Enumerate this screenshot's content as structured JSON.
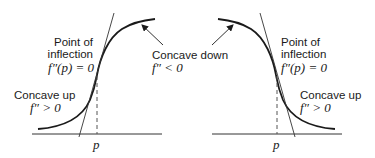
{
  "left_panel": {
    "inflection_label_line1": "Point of",
    "inflection_label_line2": "inflection",
    "inflection_formula": "f″(p) = 0",
    "concave_up_label": "Concave up",
    "concave_up_formula": "f″ > 0",
    "axis_tick_label": "p"
  },
  "right_panel": {
    "inflection_label_line1": "Point of",
    "inflection_label_line2": "inflection",
    "inflection_formula": "f″(p) = 0",
    "concave_up_label": "Concave up",
    "concave_up_formula": "f″ > 0",
    "axis_tick_label": "p"
  },
  "shared": {
    "concave_down_label": "Concave down",
    "concave_down_formula": "f″ < 0"
  },
  "colors": {
    "curve": "#1a1a1a",
    "background": "#ffffff"
  }
}
